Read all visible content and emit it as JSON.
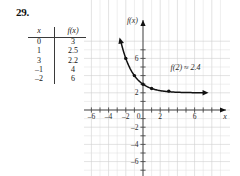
{
  "problem": {
    "number": "29."
  },
  "table": {
    "headers": {
      "x": "x",
      "fx": "f(x)"
    },
    "rows": [
      {
        "x": "0",
        "fx": "3"
      },
      {
        "x": "1",
        "fx": "2.5"
      },
      {
        "x": "3",
        "fx": "2.2"
      },
      {
        "x": "–1",
        "fx": "4"
      },
      {
        "x": "–2",
        "fx": "6"
      }
    ]
  },
  "graph": {
    "x_axis_label": "x",
    "y_axis_label": "f(x)",
    "annotation": "f(2) ≈ 2.4",
    "x_tick_labels": [
      "–6",
      "–4",
      "–2",
      "0",
      "2",
      "6"
    ],
    "y_tick_labels": [
      "6",
      "2",
      "–2",
      "–4",
      "–6"
    ],
    "colors": {
      "curve": "#111111",
      "axis": "#4a4a4a",
      "grid": "#dcdcdc",
      "background": "#ffffff"
    }
  },
  "chart_data": {
    "type": "line",
    "title": "",
    "xlabel": "x",
    "ylabel": "f(x)",
    "xlim": [
      -7.5,
      7.5
    ],
    "ylim": [
      -7.5,
      8.5
    ],
    "grid": true,
    "legend": null,
    "annotations": [
      {
        "text": "f(2) ≈ 2.4",
        "x": 3.2,
        "y": 4.6
      }
    ],
    "xticks": [
      -6,
      -4,
      -2,
      0,
      2,
      6
    ],
    "yticks": [
      6,
      2,
      -2,
      -4,
      -6
    ],
    "series": [
      {
        "name": "f(x)",
        "x": [
          -2,
          -1,
          0,
          1,
          3
        ],
        "values": [
          6,
          4,
          3,
          2.5,
          2.2
        ],
        "marker": "filled-circle",
        "arrows": [
          "left-up",
          "right"
        ]
      }
    ]
  }
}
